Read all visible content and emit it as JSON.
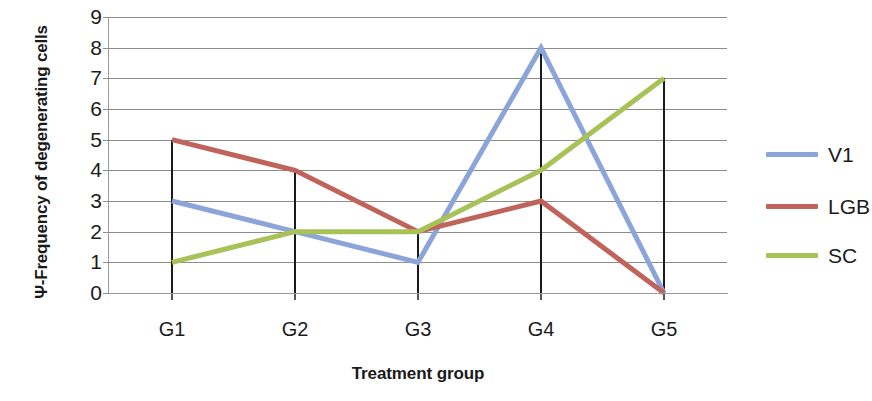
{
  "chart_data": {
    "type": "line",
    "title": "",
    "xlabel": "Treatment group",
    "ylabel": "Ψ-Frequency of degenerating cells",
    "categories": [
      "G1",
      "G2",
      "G3",
      "G4",
      "G5"
    ],
    "ylim": [
      0,
      9
    ],
    "yticks": [
      0,
      1,
      2,
      3,
      4,
      5,
      6,
      7,
      8,
      9
    ],
    "ytick_labels": [
      "0",
      "1",
      "2",
      "3",
      "4",
      "5",
      "6",
      "7",
      "8",
      "9"
    ],
    "grid": true,
    "legend_position": "right",
    "series": [
      {
        "name": "V1",
        "color": "#8ba5d9",
        "values": [
          3,
          2,
          1,
          8,
          0
        ]
      },
      {
        "name": "LGB",
        "color": "#c0635a",
        "values": [
          5,
          4,
          2,
          3,
          0
        ]
      },
      {
        "name": "SC",
        "color": "#a8c257",
        "values": [
          1,
          2,
          2,
          4,
          7
        ]
      }
    ],
    "category_drop_lines": [
      5,
      4,
      2,
      8,
      7
    ]
  },
  "colors": {
    "v1": "#8ba5d9",
    "lgb": "#c0635a",
    "sc": "#a8c257",
    "gridline": "#8c8c8c",
    "axis": "#9a9a9a",
    "drop_line": "#1a1a1a",
    "text": "#1c1c1c",
    "background": "#ffffff"
  },
  "axes": {
    "y_title": "Ψ-Frequency of degenerating cells",
    "x_title": "Treatment group"
  },
  "legend": {
    "items": [
      {
        "label": "V1"
      },
      {
        "label": "LGB"
      },
      {
        "label": "SC"
      }
    ]
  }
}
